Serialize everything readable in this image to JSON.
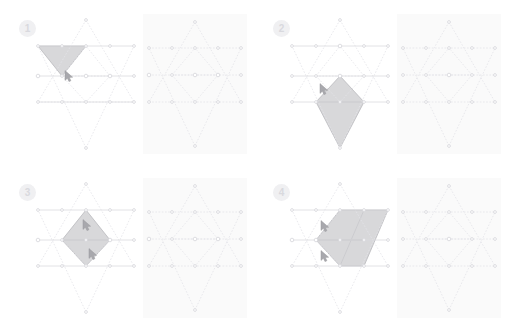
{
  "page": {
    "background_color": "#ffffff",
    "width": 507,
    "height": 327,
    "faint_header_text": ""
  },
  "style": {
    "grid_line_color": "#e3e3e8",
    "grid_line_solid_color": "#dadade",
    "grid_node_color": "#d5d5da",
    "shape_fill_color": "#d8d8da",
    "shape_stroke_color": "#b9b9bd",
    "reference_panel_background": "#fafafa",
    "badge_background": "#f0f0f2",
    "badge_text_color": "#d9d9de",
    "cursor_color": "#a8a8ad"
  },
  "panels": [
    {
      "id": "panel-1",
      "badge_label": "1",
      "working_board": {
        "name": "star-grid-working",
        "selected_shape": "single-downward-triangle-upper-left",
        "selected_shape_type": "triangle",
        "cursor_count": 1,
        "cursors": [
          {
            "x": 39,
            "y": 62
          }
        ]
      },
      "reference_board": {
        "name": "star-grid-reference",
        "selected_shape": "none",
        "cursor_count": 0,
        "cursors": []
      }
    },
    {
      "id": "panel-2",
      "badge_label": "2",
      "working_board": {
        "name": "star-grid-working",
        "selected_shape": "vertical-rhombus-lower-center",
        "selected_shape_type": "rhombus",
        "cursor_count": 1,
        "cursors": [
          {
            "x": 40,
            "y": 75
          }
        ]
      },
      "reference_board": {
        "name": "star-grid-reference",
        "selected_shape": "none",
        "cursor_count": 0,
        "cursors": []
      }
    },
    {
      "id": "panel-3",
      "badge_label": "3",
      "working_board": {
        "name": "star-grid-working",
        "selected_shape": "vertical-rhombus-center",
        "selected_shape_type": "rhombus",
        "cursor_count": 2,
        "cursors": [
          {
            "x": 57,
            "y": 47
          },
          {
            "x": 63,
            "y": 76
          }
        ]
      },
      "reference_board": {
        "name": "star-grid-reference",
        "selected_shape": "none",
        "cursor_count": 0,
        "cursors": []
      }
    },
    {
      "id": "panel-4",
      "badge_label": "4",
      "working_board": {
        "name": "star-grid-working",
        "selected_shape": "large-downward-triangle-right",
        "selected_shape_type": "triangle",
        "cursor_count": 2,
        "cursors": [
          {
            "x": 41,
            "y": 48
          },
          {
            "x": 41,
            "y": 78
          }
        ]
      },
      "reference_board": {
        "name": "star-grid-reference",
        "selected_shape": "none",
        "cursor_count": 0,
        "cursors": []
      }
    }
  ]
}
